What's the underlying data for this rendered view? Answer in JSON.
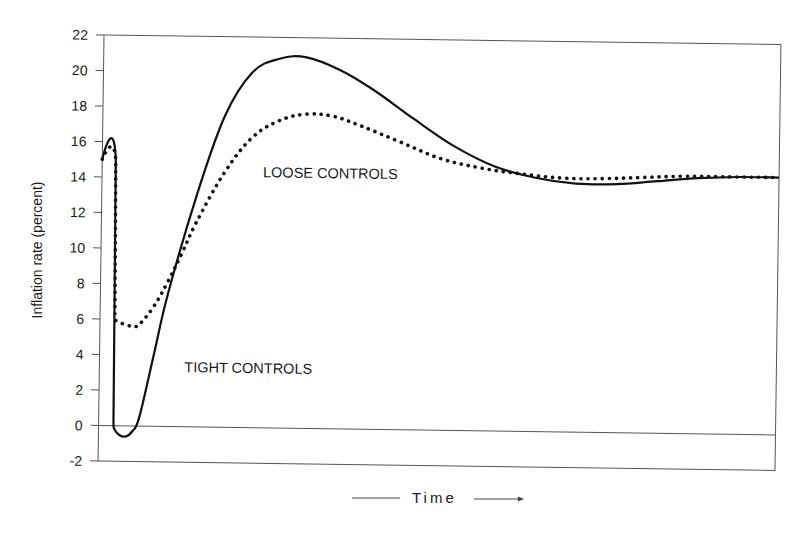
{
  "chart_data": {
    "type": "line",
    "title": "",
    "xlabel": "Time",
    "ylabel": "Inflation rate (percent)",
    "ylim": [
      -2,
      22
    ],
    "yticks": [
      -2,
      0,
      2,
      4,
      6,
      8,
      10,
      12,
      14,
      16,
      18,
      20,
      22
    ],
    "ytick_labels": [
      "-2",
      "0",
      "2",
      "4",
      "6",
      "8",
      "10",
      "12",
      "14",
      "16",
      "18",
      "20",
      "22"
    ],
    "xticks": [],
    "grid": false,
    "legend": "none (inline annotations)",
    "annotations": [
      {
        "text": "LOOSE CONTROLS",
        "series": "Loose controls"
      },
      {
        "text": "TIGHT CONTROLS",
        "series": "Tight controls"
      }
    ],
    "x_note": "Time (unitless, 0-100 across the plot width)",
    "series": [
      {
        "name": "Tight controls",
        "style": "solid",
        "x": [
          0,
          2,
          2.2,
          3,
          4,
          5,
          6,
          8,
          10,
          14,
          18,
          22,
          26,
          30,
          35,
          40,
          46,
          52,
          58,
          64,
          70,
          76,
          82,
          88,
          94,
          100
        ],
        "values": [
          15,
          15,
          0,
          -0.5,
          -0.6,
          -0.3,
          0.5,
          4,
          7.5,
          13,
          17.5,
          20,
          20.8,
          20.9,
          20.2,
          19.1,
          17.5,
          16.0,
          14.9,
          14.3,
          14.0,
          14.0,
          14.2,
          14.4,
          14.5,
          14.5
        ]
      },
      {
        "name": "Loose controls",
        "style": "dotted",
        "x": [
          0,
          2,
          2.2,
          3,
          5,
          6,
          8,
          10,
          12,
          14,
          18,
          22,
          26,
          30,
          34,
          38,
          44,
          50,
          56,
          62,
          68,
          74,
          80,
          86,
          92,
          100
        ],
        "values": [
          15,
          15,
          6,
          5.8,
          5.6,
          5.8,
          6.8,
          8.2,
          9.8,
          11.5,
          14.3,
          16.3,
          17.3,
          17.7,
          17.6,
          17.1,
          16.2,
          15.3,
          14.8,
          14.5,
          14.3,
          14.3,
          14.4,
          14.5,
          14.5,
          14.5
        ]
      }
    ]
  }
}
